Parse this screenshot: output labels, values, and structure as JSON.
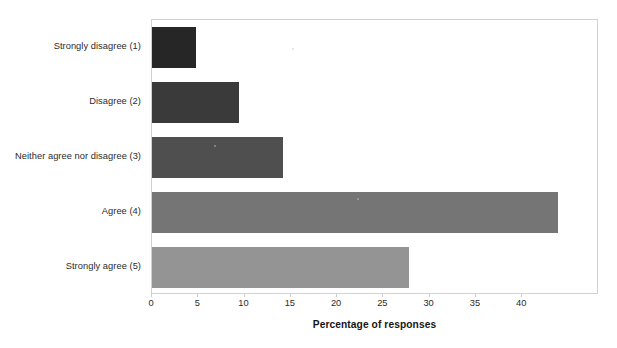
{
  "chart_data": {
    "type": "bar",
    "orientation": "horizontal",
    "title": "",
    "subtitle": "",
    "xlabel": "Percentage of responses",
    "ylabel": "",
    "categories": [
      "Strongly disagree (1)",
      "Disagree (2)",
      "Neither agree nor disagree (3)",
      "Agree (4)",
      "Strongly agree (5)"
    ],
    "values": [
      4.8,
      9.4,
      14.2,
      43.9,
      27.8
    ],
    "bar_colors": [
      "#262626",
      "#3a3a3a",
      "#4f4f4f",
      "#757575",
      "#949494"
    ],
    "xlim": [
      0,
      48.3
    ],
    "xticks": [
      0,
      5,
      10,
      15,
      20,
      25,
      30,
      35,
      40
    ],
    "xtick_labels": [
      "0",
      "5",
      "10",
      "15",
      "20",
      "25",
      "30",
      "35",
      "40"
    ],
    "grid": false,
    "legend": false,
    "legend_position": "none",
    "plot_border_color": "#d2d2d2",
    "background_color": "#ffffff",
    "text_color": "#2b2b2b"
  }
}
